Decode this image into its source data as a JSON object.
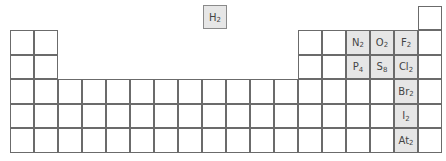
{
  "colors": {
    "highlight": "#e6e6e6",
    "border": "#6b6b6b",
    "text": "#444444"
  },
  "floating": {
    "symbol": "H",
    "subscript": "2"
  },
  "highlighted": [
    {
      "row": 2,
      "col": 15,
      "symbol": "N",
      "subscript": "2"
    },
    {
      "row": 2,
      "col": 16,
      "symbol": "O",
      "subscript": "2"
    },
    {
      "row": 2,
      "col": 17,
      "symbol": "F",
      "subscript": "2"
    },
    {
      "row": 3,
      "col": 15,
      "symbol": "P",
      "subscript": "4"
    },
    {
      "row": 3,
      "col": 16,
      "symbol": "S",
      "subscript": "8"
    },
    {
      "row": 3,
      "col": 17,
      "symbol": "Cl",
      "subscript": "2"
    },
    {
      "row": 4,
      "col": 17,
      "symbol": "Br",
      "subscript": "2"
    },
    {
      "row": 5,
      "col": 17,
      "symbol": "I",
      "subscript": "2"
    },
    {
      "row": 6,
      "col": 17,
      "symbol": "At",
      "subscript": "2"
    }
  ],
  "grid": {
    "rows": [
      {
        "row": 1,
        "cols": [
          1,
          18
        ]
      },
      {
        "row": 2,
        "cols": [
          1,
          2,
          13,
          14,
          15,
          16,
          17,
          18
        ]
      },
      {
        "row": 3,
        "cols": [
          1,
          2,
          13,
          14,
          15,
          16,
          17,
          18
        ]
      },
      {
        "row": 4,
        "cols": [
          1,
          2,
          3,
          4,
          5,
          6,
          7,
          8,
          9,
          10,
          11,
          12,
          13,
          14,
          15,
          16,
          17,
          18
        ]
      },
      {
        "row": 5,
        "cols": [
          1,
          2,
          3,
          4,
          5,
          6,
          7,
          8,
          9,
          10,
          11,
          12,
          13,
          14,
          15,
          16,
          17,
          18
        ]
      },
      {
        "row": 6,
        "cols": [
          1,
          2,
          3,
          4,
          5,
          6,
          7,
          8,
          9,
          10,
          11,
          12,
          13,
          14,
          15,
          16,
          17,
          18
        ]
      }
    ]
  }
}
